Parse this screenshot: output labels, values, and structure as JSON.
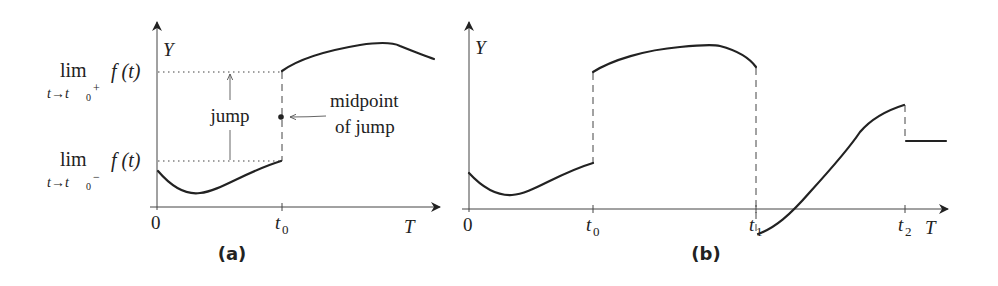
{
  "panels": {
    "a": {
      "label": "(a)",
      "y_axis_label": "Y",
      "x_axis_label": "T",
      "origin_label": "0",
      "t0_label": "t",
      "t0_sub": "0",
      "upper_limit": {
        "lim": "lim",
        "sub": "t→t",
        "sub0": "0",
        "sup": "+",
        "func": "f (t)"
      },
      "lower_limit": {
        "lim": "lim",
        "sub": "t→t",
        "sub0": "0",
        "sup": "−",
        "func": "f (t)"
      },
      "jump_label": "jump",
      "midpoint_label_line1": "midpoint",
      "midpoint_label_line2": "of jump"
    },
    "b": {
      "label": "(b)",
      "y_axis_label": "Y",
      "x_axis_label": "T",
      "origin_label": "0",
      "t0_label": "t",
      "t0_sub": "0",
      "t1_label": "t",
      "t1_sub": "1",
      "t2_label": "t",
      "t2_sub": "2"
    }
  },
  "colors": {
    "curve": "#222222",
    "axis": "#444444",
    "background": "#ffffff"
  }
}
